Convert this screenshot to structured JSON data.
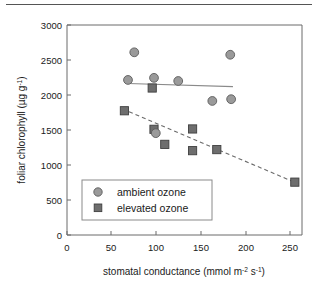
{
  "chart_data": {
    "type": "scatter",
    "title": "",
    "xlabel": "stomatal conductance (mmol m-2 s-1)",
    "xlabel_parts": {
      "main": "stomatal conductance (mmol m",
      "sup1": "-2",
      "mid": " s",
      "sup2": "-1",
      "tail": ")"
    },
    "ylabel": "foliar chlorophyll (µg g-1)",
    "ylabel_parts": {
      "main": "foliar chlorophyll (µg g",
      "sup": "-1",
      "tail": ")"
    },
    "xlim": [
      0,
      262
    ],
    "ylim": [
      0,
      3000
    ],
    "xticks": [
      0,
      50,
      100,
      150,
      200,
      250
    ],
    "yticks": [
      0,
      500,
      1000,
      1500,
      2000,
      2500,
      3000
    ],
    "grid": false,
    "legend_position": "lower-left-inside",
    "series": [
      {
        "name": "ambient ozone",
        "marker": "circle",
        "color": "#9a9a9a",
        "edge_color": "#5c5c5c",
        "points": [
          {
            "x": 68,
            "y": 2215
          },
          {
            "x": 75,
            "y": 2610
          },
          {
            "x": 97,
            "y": 2245
          },
          {
            "x": 99,
            "y": 1455
          },
          {
            "x": 124,
            "y": 2200
          },
          {
            "x": 162,
            "y": 1915
          },
          {
            "x": 182,
            "y": 2575
          },
          {
            "x": 183,
            "y": 1940
          }
        ],
        "fit_line": {
          "style": "solid",
          "x1": 68,
          "y1": 2165,
          "x2": 185,
          "y2": 2120
        }
      },
      {
        "name": "elevated ozone",
        "marker": "square",
        "color": "#6e6e6e",
        "edge_color": "#3f3f3f",
        "points": [
          {
            "x": 64,
            "y": 1775
          },
          {
            "x": 95,
            "y": 2100
          },
          {
            "x": 97,
            "y": 1510
          },
          {
            "x": 109,
            "y": 1295
          },
          {
            "x": 140,
            "y": 1515
          },
          {
            "x": 140,
            "y": 1205
          },
          {
            "x": 167,
            "y": 1220
          },
          {
            "x": 254,
            "y": 755
          }
        ],
        "fit_line": {
          "style": "dashed",
          "x1": 62,
          "y1": 1800,
          "x2": 258,
          "y2": 730
        }
      }
    ]
  },
  "legend": {
    "items": [
      {
        "label": "ambient ozone",
        "marker": "circle"
      },
      {
        "label": "elevated ozone",
        "marker": "square"
      }
    ]
  },
  "axis": {
    "y_tick_labels": [
      "3000",
      "2500",
      "2000",
      "1500",
      "1000",
      "500",
      "0"
    ],
    "x_tick_labels": [
      "0",
      "50",
      "100",
      "150",
      "200",
      "250"
    ]
  }
}
